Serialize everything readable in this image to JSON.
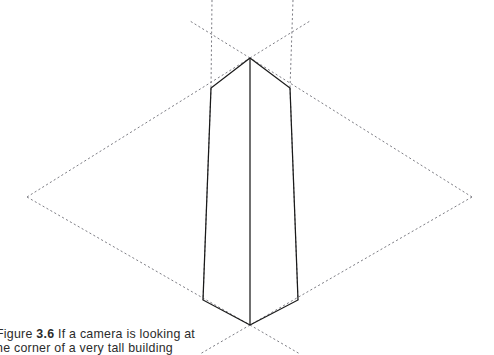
{
  "figure": {
    "caption_label": "Figure",
    "caption_number": "3.6",
    "caption_line_1": "If a camera is looking at",
    "caption_line_2": "he corner of a very tall building",
    "caption_full": "Figure 3.6 If a camera is looking at the corner of a very tall building"
  },
  "colors": {
    "solid_line": "#1a1a1a",
    "construction_line": "#6e6e76",
    "background": "#ffffff",
    "caption_text": "#2b2b2b"
  },
  "geometry": {
    "vanishing_point_left": {
      "x": 27,
      "y": 197,
      "label": "left vanishing point"
    },
    "vanishing_point_right": {
      "x": 472,
      "y": 197,
      "label": "right vanishing point"
    },
    "apex": {
      "x": 250,
      "y": 58,
      "label": "top corner of building"
    },
    "base": {
      "x": 250,
      "y": 325,
      "label": "bottom corner of building"
    },
    "top_left_corner": {
      "x": 211,
      "y": 88
    },
    "top_right_corner": {
      "x": 290,
      "y": 88
    },
    "bottom_left_corner": {
      "x": 203,
      "y": 300
    },
    "bottom_right_corner": {
      "x": 298,
      "y": 300
    },
    "dashed_vertical_left_x": 213,
    "dashed_vertical_right_x": 293
  },
  "elements": {
    "building_label": "building solid outline",
    "near_vertical_edge_label": "near vertical corner edge",
    "left_face_label": "left building face",
    "right_face_label": "right building face",
    "construction_label": "perspective construction lines"
  }
}
